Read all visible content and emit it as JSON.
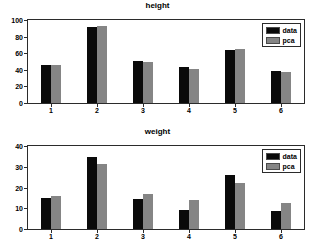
{
  "figure": {
    "background": "#ffffff",
    "series_colors": {
      "data": "#0a0a0a",
      "pca": "#858585"
    }
  },
  "chart_data": [
    {
      "type": "bar",
      "title": "height",
      "xlabel": "",
      "ylabel": "",
      "categories": [
        "1",
        "2",
        "3",
        "4",
        "5",
        "6"
      ],
      "series": [
        {
          "name": "data",
          "values": [
            46,
            92,
            51,
            43,
            64,
            39
          ]
        },
        {
          "name": "pca",
          "values": [
            46,
            93,
            50,
            41.5,
            65.5,
            37.5
          ]
        }
      ],
      "ylim": [
        0,
        100
      ],
      "yticks": [
        0,
        20,
        40,
        60,
        80,
        100
      ],
      "xticks": [
        "1",
        "2",
        "3",
        "4",
        "5",
        "6"
      ],
      "grid": false,
      "legend": {
        "position": "upper right",
        "entries": [
          "data",
          "pca"
        ]
      }
    },
    {
      "type": "bar",
      "title": "weight",
      "xlabel": "",
      "ylabel": "",
      "categories": [
        "1",
        "2",
        "3",
        "4",
        "5",
        "6"
      ],
      "series": [
        {
          "name": "data",
          "values": [
            15,
            34.5,
            14.5,
            9.2,
            26,
            8.8
          ]
        },
        {
          "name": "pca",
          "values": [
            15.8,
            31.5,
            17,
            14,
            22.3,
            12.6
          ]
        }
      ],
      "ylim": [
        0,
        40
      ],
      "yticks": [
        0,
        10,
        20,
        30,
        40
      ],
      "xticks": [
        "1",
        "2",
        "3",
        "4",
        "5",
        "6"
      ],
      "grid": false,
      "legend": {
        "position": "upper right",
        "entries": [
          "data",
          "pca"
        ]
      }
    }
  ]
}
